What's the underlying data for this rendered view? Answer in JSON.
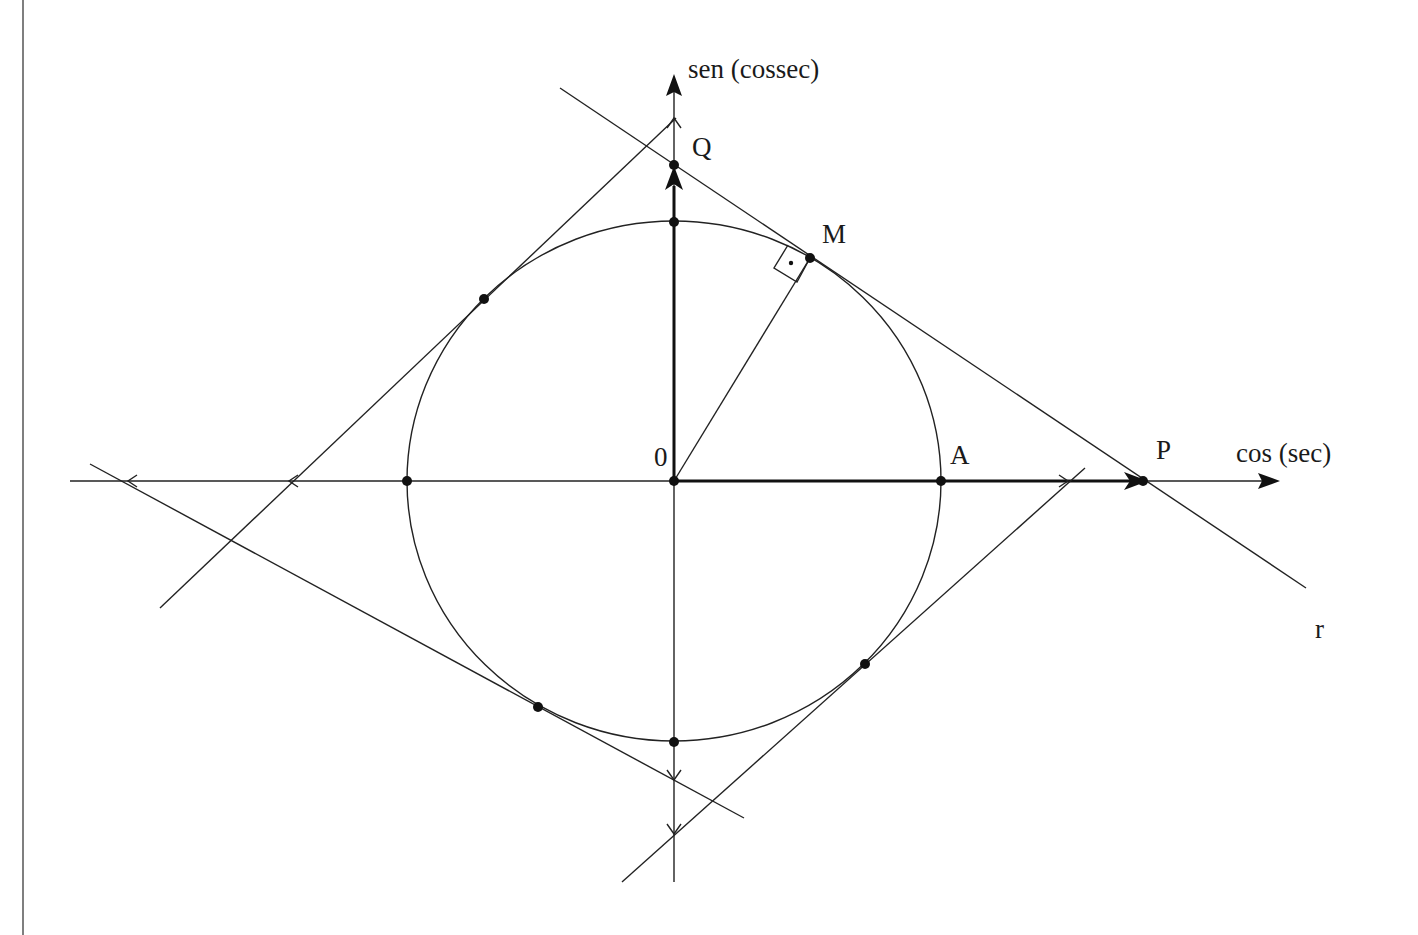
{
  "diagram": {
    "colors": {
      "stroke": "#222222",
      "background": "#ffffff"
    },
    "axes": {
      "horizontal_label": "cos (sec)",
      "vertical_label": "sen (cossec)"
    },
    "points": {
      "origin": "0",
      "A": "A",
      "M": "M",
      "P": "P",
      "Q": "Q"
    },
    "lines": {
      "tangent_line": "r"
    }
  }
}
